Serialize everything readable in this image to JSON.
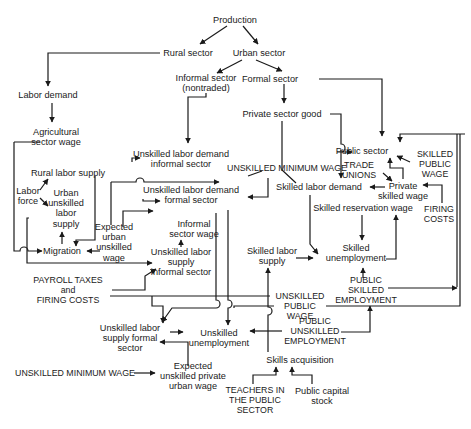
{
  "diagram": {
    "nodes": [
      {
        "id": "production",
        "label": "Production",
        "x": 235,
        "y": 20
      },
      {
        "id": "rural_sector",
        "label": "Rural sector",
        "x": 188,
        "y": 53
      },
      {
        "id": "urban_sector",
        "label": "Urban sector",
        "x": 259,
        "y": 53
      },
      {
        "id": "informal_sector",
        "label": "Informal sector\n(nontraded)",
        "x": 206,
        "y": 83
      },
      {
        "id": "formal_sector",
        "label": "Formal sector",
        "x": 270,
        "y": 79
      },
      {
        "id": "labor_demand",
        "label": "Labor demand",
        "x": 48,
        "y": 95
      },
      {
        "id": "private_sector_good",
        "label": "Private sector good",
        "x": 282,
        "y": 114
      },
      {
        "id": "agricultural_sector_wage",
        "label": "Agricultural\nsector wage",
        "x": 56,
        "y": 137
      },
      {
        "id": "unskilled_labor_demand_informal",
        "label": "Unskilled labor demand\ninformal sector",
        "x": 181,
        "y": 159
      },
      {
        "id": "public_sector",
        "label": "Public sector",
        "x": 362,
        "y": 151
      },
      {
        "id": "skilled_public_wage",
        "label": "SKILLED\nPUBLIC\nWAGE",
        "x": 435,
        "y": 164,
        "caps": true
      },
      {
        "id": "unskilled_minimum_wage_top",
        "label": "UNSKILLED MINIMUM WAGE",
        "x": 287,
        "y": 168,
        "caps": true
      },
      {
        "id": "trade_unions",
        "label": "TRADE\nUNIONS",
        "x": 359,
        "y": 170,
        "caps": true
      },
      {
        "id": "rural_labor_supply",
        "label": "Rural labor supply",
        "x": 68,
        "y": 173
      },
      {
        "id": "unskilled_labor_demand_formal",
        "label": "Unskilled labor demand\nformal sector",
        "x": 191,
        "y": 195
      },
      {
        "id": "skilled_labor_demand",
        "label": "Skilled labor demand",
        "x": 319,
        "y": 187
      },
      {
        "id": "private_skilled_wage",
        "label": "Private\nskilled wage",
        "x": 403,
        "y": 191
      },
      {
        "id": "labor_force",
        "label": "Labor\nforce",
        "x": 28,
        "y": 196
      },
      {
        "id": "urban_unskilled_labor_supply",
        "label": "Urban\nunskilled\nlabor\nsupply",
        "x": 66,
        "y": 208
      },
      {
        "id": "firing_costs_right",
        "label": "FIRING\nCOSTS",
        "x": 439,
        "y": 214,
        "caps": true
      },
      {
        "id": "skilled_reservation_wage",
        "label": "Skilled reservation wage",
        "x": 363,
        "y": 208
      },
      {
        "id": "informal_sector_wage",
        "label": "Informal\nsector wage",
        "x": 194,
        "y": 229
      },
      {
        "id": "expected_urban_unskilled_wage",
        "label": "Expected\nurban\nunskilled\nwage",
        "x": 114,
        "y": 242
      },
      {
        "id": "migration",
        "label": "Migration",
        "x": 62,
        "y": 251
      },
      {
        "id": "skilled_unemployment",
        "label": "Skilled\nunemployment",
        "x": 356,
        "y": 253
      },
      {
        "id": "skilled_labor_supply",
        "label": "Skilled labor\nsupply",
        "x": 272,
        "y": 256
      },
      {
        "id": "unskilled_labor_supply_informal",
        "label": "Unskilled labor\nsupply\ninformal sector",
        "x": 181,
        "y": 262
      },
      {
        "id": "payroll_taxes_firing_costs",
        "label": "PAYROLL TAXES\nand\nFIRING COSTS",
        "x": 68,
        "y": 290,
        "caps": true
      },
      {
        "id": "public_skilled_employment",
        "label": "PUBLIC\nSKILLED\nEMPLOYMENT",
        "x": 366,
        "y": 290,
        "caps": true
      },
      {
        "id": "unskilled_public_wage",
        "label": "UNSKILLED\nPUBLIC\nWAGE",
        "x": 300,
        "y": 306,
        "caps": true
      },
      {
        "id": "public_unskilled_employment",
        "label": "PUBLIC\nUNSKILLED\nEMPLOYMENT",
        "x": 315,
        "y": 331,
        "caps": true
      },
      {
        "id": "unskilled_labor_supply_formal",
        "label": "Unskilled labor\nsupply formal\nsector",
        "x": 130,
        "y": 338
      },
      {
        "id": "unskilled_unemployment",
        "label": "Unskilled\nunemployment",
        "x": 219,
        "y": 338
      },
      {
        "id": "skills_acquisition",
        "label": "Skills acquisition",
        "x": 300,
        "y": 360
      },
      {
        "id": "unskilled_minimum_wage_bottom",
        "label": "UNSKILLED MINIMUM WAGE",
        "x": 75,
        "y": 373,
        "caps": true
      },
      {
        "id": "expected_unskilled_private_urban_wage",
        "label": "Expected\nunskilled private\nurban wage",
        "x": 193,
        "y": 376
      },
      {
        "id": "teachers_public_sector",
        "label": "TEACHERS IN\nTHE PUBLIC\nSECTOR",
        "x": 255,
        "y": 400,
        "caps": true
      },
      {
        "id": "public_capital_stock",
        "label": "Public capital\nstock",
        "x": 322,
        "y": 396
      }
    ],
    "edges": [
      {
        "name": "production-to-rural",
        "d": "M227 26 L200 44",
        "arrow": true
      },
      {
        "name": "production-to-urban",
        "d": "M243 26 L258 44",
        "arrow": true
      },
      {
        "name": "rural-to-labor-demand",
        "d": "M160 53 L48 53 L48 86",
        "arrow": true
      },
      {
        "name": "urban-to-informal",
        "d": "M242 60 L217 73",
        "arrow": true
      },
      {
        "name": "urban-to-formal",
        "d": "M256 60 L282 71",
        "arrow": true
      },
      {
        "name": "labor-demand-to-ag-wage",
        "d": "M52 103 L52 122",
        "arrow": true
      },
      {
        "name": "formal-to-private-good",
        "d": "M284 84 L284 103",
        "arrow": true
      },
      {
        "name": "formal-to-public-sector",
        "d": "M319 79 L382 79 L382 136",
        "arrow": true
      },
      {
        "name": "informal-to-unskilled-demand-informal",
        "d": "M206 93 L206 97 L188 97 L188 143",
        "arrow": true
      },
      {
        "name": "private-good-to-skilled-demand",
        "d": "M282 121 L282 170 L296 183",
        "arrow": false
      },
      {
        "name": "private-good-to-public-sector",
        "d": "M330 114 L341 114 L341 144 A4 4 0 0 1 341 152 L337 152 L352 152",
        "arrow": true
      },
      {
        "name": "skilled-public-wage-loop",
        "d": "M465 134 L400 134 L400 142",
        "arrow": true
      },
      {
        "name": "right-border-loop",
        "d": "M457 134 L457 287",
        "arrow": false
      },
      {
        "name": "skilled-public-wage-to-public-sector",
        "d": "M410 162 L397 156",
        "arrow": true
      },
      {
        "name": "private-wage-to-public-sector",
        "d": "M403 179 L403 168 L390 168 L390 158",
        "arrow": true
      },
      {
        "name": "trade-unions-to-private-wage",
        "d": "M383 173 L392 181",
        "arrow": true
      },
      {
        "name": "private-wage-to-skilled-demand",
        "d": "M385 187 L370 187",
        "arrow": true
      },
      {
        "name": "firing-costs-to-private-wage",
        "d": "M442 203 L442 185 L423 185",
        "arrow": true
      },
      {
        "name": "public-sector-to-skilled-demand",
        "d": "M341 150 L341 178",
        "arrow": true
      },
      {
        "name": "min-wage-to-demand-informal",
        "d": "M262 171 L248 176",
        "arrow": false
      },
      {
        "name": "min-wage-to-demand-formal",
        "d": "M268 178 L268 197 L248 197",
        "arrow": true
      },
      {
        "name": "skilled-res-wage-to-skilled-unemp",
        "d": "M362 215 L362 240",
        "arrow": true
      },
      {
        "name": "skilled-demand-to-skilled-unemp",
        "d": "M310 195 L310 244 L318 254",
        "arrow": true
      },
      {
        "name": "skilled-unemp-to-res-wage",
        "d": "M386 259 L396 259 L396 215",
        "arrow": true
      },
      {
        "name": "skilled-supply-to-unemp",
        "d": "M296 258 L313 258",
        "arrow": true
      },
      {
        "name": "public-skilled-emp-to-skilled-unemp",
        "d": "M363 278 L363 268",
        "arrow": true
      },
      {
        "name": "public-skilled-emp-to-right",
        "d": "M388 288 L457 288",
        "arrow": true
      },
      {
        "name": "unskilled-public-wage-line",
        "d": "M326 306 L460 306 L460 134",
        "arrow": false
      },
      {
        "name": "public-unskilled-to-skilled-emp",
        "d": "M341 332 L370 332 L370 306",
        "arrow": true
      },
      {
        "name": "public-unskilled-to-unskilled-unemp",
        "d": "M282 331 L250 331",
        "arrow": true
      },
      {
        "name": "skills-acq-up",
        "d": "M268 352 L268 315 A4 4 0 0 0 268 307 L268 268",
        "arrow": true
      },
      {
        "name": "teachers-to-skills",
        "d": "M253 384 L253 375 L276 375 L276 367",
        "arrow": true
      },
      {
        "name": "capital-to-skills",
        "d": "M312 384 L312 375 L292 375 L292 367",
        "arrow": true
      },
      {
        "name": "ag-wage-to-migration",
        "d": "M14 142 L40 142 M14 142 L14 251 L20 251 A4 4 0 0 1 28 251 L42 251",
        "arrow": true
      },
      {
        "name": "labor-force-to-rural",
        "d": "M40 190 L48 179",
        "arrow": true
      },
      {
        "name": "labor-force-to-urban",
        "d": "M40 198 L48 206",
        "arrow": true
      },
      {
        "name": "migration-to-urban-supply",
        "d": "M62 244 L62 232",
        "arrow": true
      },
      {
        "name": "rural-supply-to-migration",
        "d": "M95 176 L95 240 L76 240 L76 246",
        "arrow": true
      },
      {
        "name": "exp-wage-to-migration",
        "d": "M100 251 L87 251",
        "arrow": true
      },
      {
        "name": "urban-supply-to-informal-loop",
        "d": "M29 218 L27 218 L27 263 L152 263",
        "arrow": true
      },
      {
        "name": "exp-wage-inputs",
        "d": "M111 182 L111 225 M111 182 L136 182 A4 4 0 0 1 144 182 L219 182",
        "arrow": true
      },
      {
        "name": "informal-wage-to-exp-wage",
        "d": "M123 227 L123 211 L153 211",
        "arrow": true
      },
      {
        "name": "demand-informal-arrow",
        "d": "M132 162 L132 158 L140 158",
        "arrow": true
      },
      {
        "name": "demand-formal-arrow",
        "d": "M143 199 L143 201 L160 201",
        "arrow": true
      },
      {
        "name": "informal-supply-to-wage",
        "d": "M181 247 L181 240",
        "arrow": true
      },
      {
        "name": "payroll-to-informal",
        "d": "M112 290 L145 290 L145 276 L156 269",
        "arrow": true
      },
      {
        "name": "payroll-to-unskilled",
        "d": "M110 296 L270 296",
        "arrow": false
      },
      {
        "name": "formal-supply-to-unemployment",
        "d": "M170 332 L183 332",
        "arrow": true
      },
      {
        "name": "exp-private-wage-to-formal-supply",
        "d": "M188 366 L188 342 L160 342",
        "arrow": true
      },
      {
        "name": "min-wage-to-exp-private",
        "d": "M134 373 L155 373",
        "arrow": true
      },
      {
        "name": "informal-to-formal-supply",
        "d": "M152 296 L152 306 L163 306 L163 323",
        "arrow": true
      },
      {
        "name": "demand-formal-to-formal-supply",
        "d": "M216 213 L216 300 A4 4 0 0 1 216 308 L172 308 L162 322",
        "arrow": true
      },
      {
        "name": "public-wage-to-unskilled-unemp",
        "d": "M228 210 L228 300 A4 4 0 0 1 228 308 L228 325",
        "arrow": true
      },
      {
        "name": "public-wage-line-left",
        "d": "M234 308 L234 306 L274 306",
        "arrow": false
      }
    ]
  }
}
